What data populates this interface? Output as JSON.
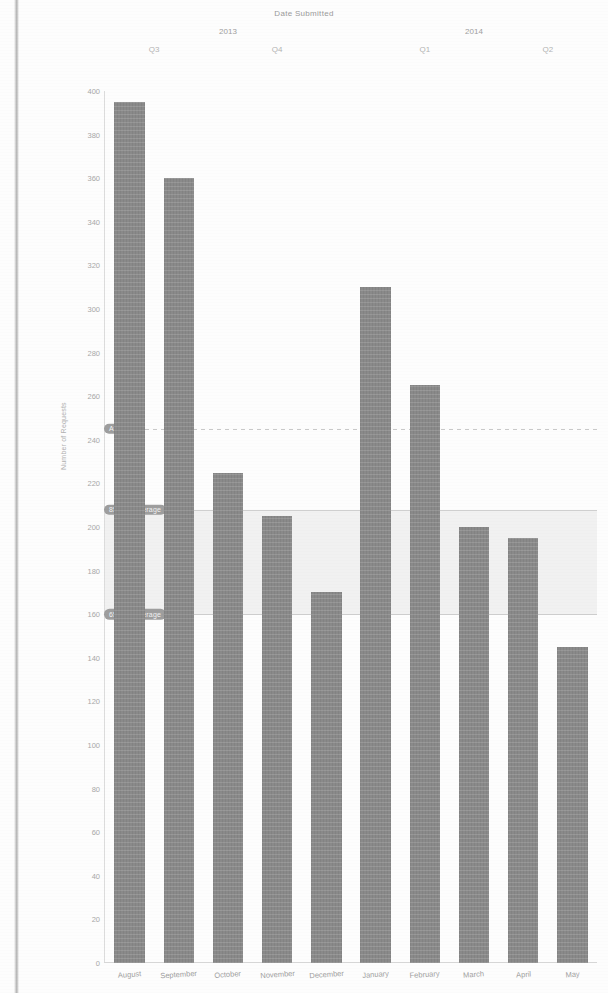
{
  "chart_data": {
    "type": "bar",
    "title": "Date Submitted",
    "xlabel": "",
    "ylabel": "Number of Requests",
    "ylim": [
      0,
      400
    ],
    "ytick_step": 20,
    "yticks": [
      400,
      380,
      360,
      340,
      320,
      300,
      280,
      260,
      240,
      220,
      200,
      180,
      160,
      140,
      120,
      100,
      80,
      60,
      40,
      20,
      0
    ],
    "grid": false,
    "legend": "none",
    "categories": [
      "August",
      "September",
      "October",
      "November",
      "December",
      "January",
      "February",
      "March",
      "April",
      "May"
    ],
    "values": [
      395,
      360,
      225,
      205,
      170,
      310,
      265,
      200,
      195,
      145
    ],
    "series": [
      {
        "name": "Number of Requests",
        "values": [
          395,
          360,
          225,
          205,
          170,
          310,
          265,
          200,
          195,
          145
        ],
        "color": "#8a8a8a"
      }
    ],
    "group_headers": [
      {
        "label": "2013",
        "span_start": 0,
        "span_end": 4
      },
      {
        "label": "2014",
        "span_start": 5,
        "span_end": 9
      }
    ],
    "quarter_headers": [
      {
        "label": "Q3",
        "span_start": 0,
        "span_end": 1
      },
      {
        "label": "Q4",
        "span_start": 2,
        "span_end": 4
      },
      {
        "label": "Q1",
        "span_start": 5,
        "span_end": 7
      },
      {
        "label": "Q2",
        "span_start": 8,
        "span_end": 9
      }
    ],
    "reference_lines": [
      {
        "label": "Average",
        "value": 245,
        "style": "dashed"
      },
      {
        "label": "85% of Average",
        "value": 208,
        "style": "solid"
      },
      {
        "label": "65% of Average",
        "value": 160,
        "style": "solid"
      }
    ],
    "shaded_band": {
      "from": 160,
      "to": 208,
      "color": "#ececec"
    },
    "annotations": []
  }
}
